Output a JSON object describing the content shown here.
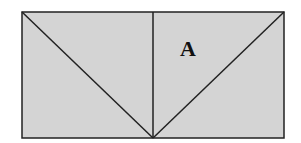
{
  "diagram": {
    "fill_color": "#d4d4d4",
    "stroke_color": "#222222",
    "rectangle": {
      "x": 22,
      "y": 12,
      "width": 262,
      "height": 126
    },
    "lines": [
      {
        "name": "left-diagonal",
        "x1": 22,
        "y1": 12,
        "x2": 153,
        "y2": 138
      },
      {
        "name": "center-vertical",
        "x1": 153,
        "y1": 12,
        "x2": 153,
        "y2": 138
      },
      {
        "name": "right-diagonal",
        "x1": 153,
        "y1": 138,
        "x2": 284,
        "y2": 12
      }
    ],
    "region_label": {
      "text": "A",
      "x": 188,
      "y": 56
    }
  }
}
